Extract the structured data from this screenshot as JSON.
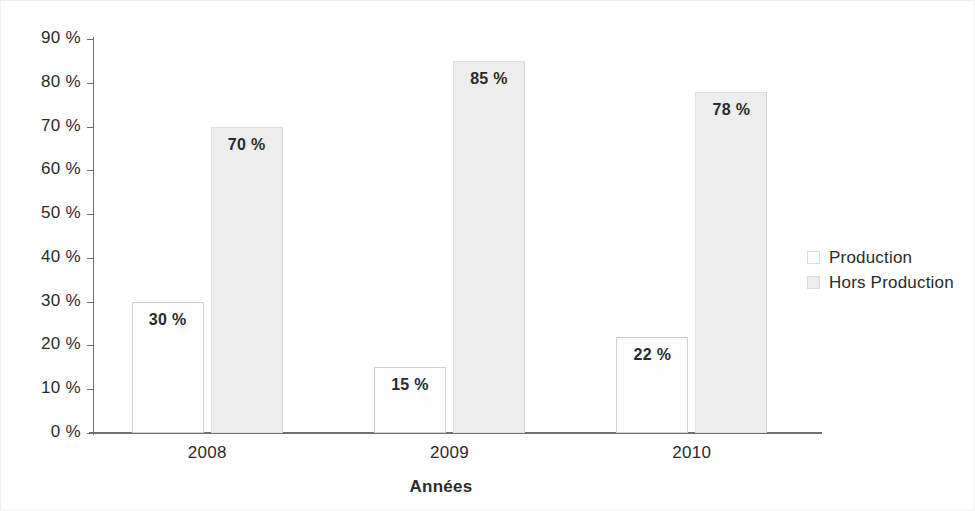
{
  "chart_data": {
    "type": "bar",
    "title": "",
    "subtitle": "",
    "xlabel": "Années",
    "ylabel": "",
    "categories": [
      "2008",
      "2009",
      "2010"
    ],
    "series": [
      {
        "name": "Production",
        "color": "#fcfcfc",
        "values": [
          30,
          15,
          22
        ],
        "labels": [
          "30 %",
          "15 %",
          "22 %"
        ]
      },
      {
        "name": "Hors Production",
        "color": "#ededed",
        "values": [
          70,
          85,
          78
        ],
        "labels": [
          "70 %",
          "85 %",
          "78 %"
        ]
      }
    ],
    "ylim": [
      0,
      90
    ],
    "ytick_values": [
      90,
      80,
      70,
      60,
      50,
      40,
      30,
      20,
      10,
      0
    ],
    "ytick_labels": [
      "90 %",
      "80 %",
      "70 %",
      "60 %",
      "50 %",
      "40 %",
      "30 %",
      "20 %",
      "10 %",
      "0 %"
    ],
    "grid": false,
    "legend_position": "right",
    "legend_entries": [
      "Production",
      "Hors Production"
    ],
    "axis_color": "#6f6f6f",
    "text_color": "#2b2b2b"
  }
}
